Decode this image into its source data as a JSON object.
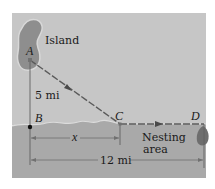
{
  "diagram": {
    "labels": {
      "island": "Island",
      "nesting_line1": "Nesting",
      "nesting_line2": "area",
      "distance_ab": "5 mi",
      "distance_bd": "12 mi",
      "variable_x": "x"
    },
    "points": {
      "A": "A",
      "B": "B",
      "C": "C",
      "D": "D"
    },
    "colors": {
      "water": "#c6c6c6",
      "land": "#a9a9a9",
      "island": "#8e8e8e",
      "path": "#5a5a5a",
      "dimension": "#707070"
    }
  }
}
